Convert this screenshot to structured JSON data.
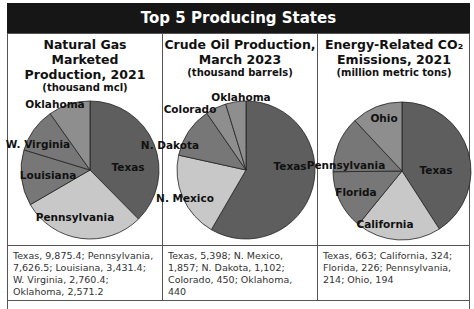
{
  "header": {
    "title": "Top 5 Producing States"
  },
  "panels": [
    {
      "title_line1": "Natural Gas Marketed",
      "title_line2": "Production, 2021",
      "unit": "(thousand mcl)",
      "description": "Texas, 9,875.4; Pennsylvania, 7,626.5; Louisiana, 3,431.4; W. Virginia, 2,760.4; Oklahoma, 2,571.2"
    },
    {
      "title_line1": "Crude Oil Production,",
      "title_line2": "March 2023",
      "unit": "(thousand barrels)",
      "description": "Texas, 5,398; N. Mexico, 1,857; N. Dakota, 1,102; Colorado, 450; Oklahoma, 440"
    },
    {
      "title_line1": "Energy-Related CO₂",
      "title_line2": "Emissions, 2021",
      "unit": "(million metric tons)",
      "description": "Texas, 663; California, 324; Florida, 226; Pennsylvania, 214; Ohio, 194"
    }
  ],
  "colors": {
    "header_bg": "#161616",
    "dark": "#5e5e5e",
    "light": "#c8c8c8",
    "mid": "#777777",
    "midlight": "#8e8e8e"
  },
  "chart_data": [
    {
      "type": "pie",
      "title": "Natural Gas Marketed Production, 2021 (thousand mcl)",
      "categories": [
        "Texas",
        "Pennsylvania",
        "Louisiana",
        "W. Virginia",
        "Oklahoma"
      ],
      "values": [
        9875.4,
        7626.5,
        3431.4,
        2760.4,
        2571.2
      ]
    },
    {
      "type": "pie",
      "title": "Crude Oil Production, March 2023 (thousand barrels)",
      "categories": [
        "Texas",
        "N. Mexico",
        "N. Dakota",
        "Colorado",
        "Oklahoma"
      ],
      "values": [
        5398,
        1857,
        1102,
        450,
        440
      ]
    },
    {
      "type": "pie",
      "title": "Energy-Related CO2 Emissions, 2021 (million metric tons)",
      "categories": [
        "Texas",
        "California",
        "Florida",
        "Pennsylvania",
        "Ohio"
      ],
      "values": [
        663,
        324,
        226,
        214,
        194
      ]
    }
  ]
}
